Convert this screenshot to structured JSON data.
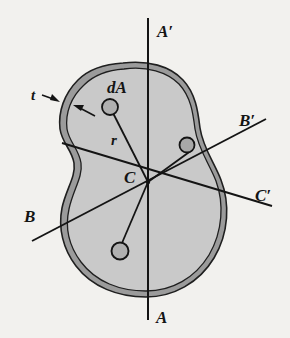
{
  "figure": {
    "background_color": "#f2f1ee",
    "shell": {
      "wall_color": "#9b9b9b",
      "interior_color": "#c9c9c9",
      "outline_color": "#1a1a1a"
    },
    "axes": [
      {
        "name": "A-A'",
        "start_label": "A",
        "end_label": "A'",
        "orientation": "vertical"
      },
      {
        "name": "B-B'",
        "start_label": "B",
        "end_label": "B'",
        "orientation": "diagonal-up-right"
      },
      {
        "name": "C-C'",
        "start_label": "C",
        "end_label": "C'",
        "orientation": "diagonal-down-right"
      }
    ],
    "labels": {
      "a_prime": "A′",
      "b_prime": "B′",
      "c_prime": "C′",
      "a": "A",
      "b": "B",
      "thickness": "t",
      "area_element": "dA",
      "radius": "r",
      "centroid": "C"
    },
    "elements": [
      {
        "name": "area-element-top",
        "shape": "circle",
        "cx": 110,
        "cy": 107,
        "r": 8
      },
      {
        "name": "area-element-right",
        "shape": "circle",
        "cx": 187,
        "cy": 145,
        "r": 7.5
      },
      {
        "name": "area-element-bottom",
        "shape": "circle",
        "cx": 120,
        "cy": 251,
        "r": 8.5
      },
      {
        "name": "centroid-point",
        "shape": "point",
        "cx": 148,
        "cy": 182
      }
    ],
    "thickness_arrows": [
      {
        "name": "thickness-arrow-left",
        "from_x": 42,
        "from_y": 94,
        "to_x": 55,
        "to_y": 99
      },
      {
        "name": "thickness-arrow-right",
        "from_x": 92,
        "from_y": 114,
        "to_x": 74,
        "to_y": 105
      }
    ]
  }
}
